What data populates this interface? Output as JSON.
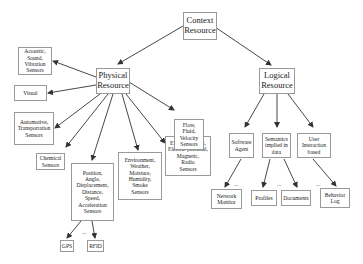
{
  "diagram": {
    "root": {
      "id": "context",
      "label": "Context\nResource"
    },
    "nodes": [
      {
        "id": "context",
        "label": "Context\nResource",
        "x": 183,
        "y": 12,
        "w": 34,
        "h": 28,
        "size": "lg"
      },
      {
        "id": "physical",
        "label": "Physical\nResource",
        "x": 96,
        "y": 68,
        "w": 34,
        "h": 26,
        "size": "lg"
      },
      {
        "id": "logical",
        "label": "Logical\nResource",
        "x": 259,
        "y": 68,
        "w": 36,
        "h": 26,
        "size": "lg"
      },
      {
        "id": "acoustic",
        "label": "Acoustic,\nSound,\nVibration\nSensors",
        "x": 18,
        "y": 47,
        "w": 34,
        "h": 28,
        "size": "sm"
      },
      {
        "id": "visual",
        "label": "Visual",
        "x": 14,
        "y": 85,
        "w": 33,
        "h": 16,
        "size": "sm"
      },
      {
        "id": "automotive",
        "label": "Automotive,\nTransportation\nSensors",
        "x": 14,
        "y": 112,
        "w": 40,
        "h": 33,
        "size": "sm"
      },
      {
        "id": "chemical",
        "label": "Chemical\nSensors",
        "x": 36,
        "y": 153,
        "w": 29,
        "h": 17,
        "size": "sm"
      },
      {
        "id": "position",
        "label": "Position,\nAngle,\nDisplacement,\nDistance,\nSpeed,\nAcceleration\nSensors",
        "x": 71,
        "y": 163,
        "w": 43,
        "h": 58,
        "size": "sm"
      },
      {
        "id": "environment",
        "label": "Environment,\nWeather,\nMoisture,\nHumidity,\nSmoke\nSensors",
        "x": 118,
        "y": 152,
        "w": 44,
        "h": 48,
        "size": "sm"
      },
      {
        "id": "electric",
        "label": "Electric current,\nElectric potential,\nMagnetic,\nRadio\nSensors",
        "x": 165,
        "y": 136,
        "w": 46,
        "h": 40,
        "size": "sm"
      },
      {
        "id": "flow",
        "label": "Flow,\nFluid,\nVelocity\nSensors",
        "x": 174,
        "y": 119,
        "w": 30,
        "h": 31,
        "size": "sm"
      },
      {
        "id": "software",
        "label": "Software\nAgent",
        "x": 229,
        "y": 133,
        "w": 25,
        "h": 25,
        "size": "sm"
      },
      {
        "id": "semantics",
        "label": "Semantics\nimplied in\ndata",
        "x": 262,
        "y": 133,
        "w": 29,
        "h": 25,
        "size": "sm"
      },
      {
        "id": "userinteraction",
        "label": "User\nInteraction\nbased",
        "x": 297,
        "y": 133,
        "w": 34,
        "h": 25,
        "size": "sm"
      },
      {
        "id": "network",
        "label": "Network\nMonitor",
        "x": 211,
        "y": 189,
        "w": 31,
        "h": 20,
        "size": "sm"
      },
      {
        "id": "profiles",
        "label": "Profiles",
        "x": 251,
        "y": 190,
        "w": 26,
        "h": 16,
        "size": "sm"
      },
      {
        "id": "documents",
        "label": "Documents",
        "x": 281,
        "y": 190,
        "w": 30,
        "h": 16,
        "size": "sm"
      },
      {
        "id": "behavior",
        "label": "Behavior\nLog",
        "x": 320,
        "y": 188,
        "w": 30,
        "h": 20,
        "size": "sm"
      },
      {
        "id": "gps",
        "label": "GPS",
        "x": 60,
        "y": 240,
        "w": 14,
        "h": 12,
        "size": "sm"
      },
      {
        "id": "rfid",
        "label": "RFID",
        "x": 87,
        "y": 240,
        "w": 17,
        "h": 12,
        "size": "sm"
      }
    ],
    "edges": [
      {
        "from": "context",
        "to": "physical",
        "x1": 183,
        "y1": 26,
        "x2": 118,
        "y2": 64
      },
      {
        "from": "context",
        "to": "logical",
        "x1": 215,
        "y1": 27,
        "x2": 271,
        "y2": 65
      },
      {
        "from": "physical",
        "to": "acoustic",
        "x1": 96,
        "y1": 77,
        "x2": 53,
        "y2": 61
      },
      {
        "from": "physical",
        "to": "visual",
        "x1": 96,
        "y1": 85,
        "x2": 48,
        "y2": 93
      },
      {
        "from": "physical",
        "to": "automotive",
        "x1": 100,
        "y1": 94,
        "x2": 55,
        "y2": 128
      },
      {
        "from": "physical",
        "to": "chemical",
        "x1": 108,
        "y1": 94,
        "x2": 66,
        "y2": 147
      },
      {
        "from": "physical",
        "to": "position",
        "x1": 113,
        "y1": 94,
        "x2": 92,
        "y2": 160
      },
      {
        "from": "physical",
        "to": "environment",
        "x1": 122,
        "y1": 94,
        "x2": 138,
        "y2": 150
      },
      {
        "from": "physical",
        "to": "electric",
        "x1": 126,
        "y1": 94,
        "x2": 165,
        "y2": 143
      },
      {
        "from": "physical",
        "to": "flow",
        "x1": 129,
        "y1": 82,
        "x2": 174,
        "y2": 110
      },
      {
        "from": "logical",
        "to": "software",
        "x1": 264,
        "y1": 94,
        "x2": 245,
        "y2": 127
      },
      {
        "from": "logical",
        "to": "semantics",
        "x1": 277,
        "y1": 94,
        "x2": 277,
        "y2": 127
      },
      {
        "from": "logical",
        "to": "userinteraction",
        "x1": 288,
        "y1": 94,
        "x2": 313,
        "y2": 127
      },
      {
        "from": "software",
        "to": "network",
        "x1": 241,
        "y1": 159,
        "x2": 225,
        "y2": 187
      },
      {
        "from": "semantics",
        "to": "profiles",
        "x1": 270,
        "y1": 159,
        "x2": 263,
        "y2": 187
      },
      {
        "from": "semantics",
        "to": "documents",
        "x1": 284,
        "y1": 159,
        "x2": 297,
        "y2": 187
      },
      {
        "from": "userinteraction",
        "to": "behavior",
        "x1": 313,
        "y1": 159,
        "x2": 336,
        "y2": 186
      },
      {
        "from": "position",
        "to": "gps",
        "x1": 81,
        "y1": 221,
        "x2": 67,
        "y2": 238
      },
      {
        "from": "position",
        "to": "rfid",
        "x1": 92,
        "y1": 221,
        "x2": 95,
        "y2": 238
      }
    ],
    "ellipses": [
      {
        "near": "network",
        "text": "...",
        "x": 234,
        "y": 181
      },
      {
        "near": "profiles-documents",
        "text": "...",
        "x": 277,
        "y": 181
      },
      {
        "near": "behavior",
        "text": "...",
        "x": 316,
        "y": 181
      },
      {
        "near": "gps-rfid",
        "text": "...",
        "x": 82,
        "y": 229
      }
    ],
    "colors": {
      "border": "#9a9a9a",
      "edge": "#333333",
      "text": "#222222",
      "background": "#ffffff"
    }
  }
}
